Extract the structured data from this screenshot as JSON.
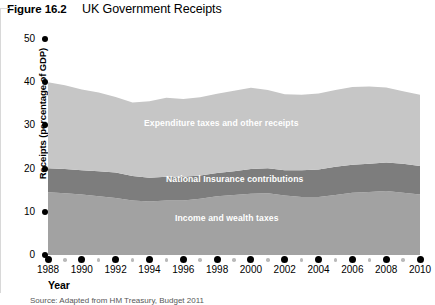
{
  "figure": {
    "number": "Figure 16.2",
    "title": "UK Government Receipts",
    "source": "Source: Adapted from HM Treasury, Budget 2011"
  },
  "chart_data": {
    "type": "area",
    "stacked": true,
    "title": "UK Government Receipts",
    "xlabel": "Year",
    "ylabel": "Receipts (percentage of GDP)",
    "xlim": [
      1988,
      2010
    ],
    "ylim": [
      0,
      50
    ],
    "yticks": [
      0,
      10,
      20,
      30,
      40,
      50
    ],
    "xticks": [
      1988,
      1990,
      1992,
      1994,
      1996,
      1998,
      2000,
      2002,
      2004,
      2006,
      2008,
      2010
    ],
    "grid": false,
    "legend": "inline-band-labels",
    "x": [
      1988,
      1989,
      1990,
      1991,
      1992,
      1993,
      1994,
      1995,
      1996,
      1997,
      1998,
      1999,
      2000,
      2001,
      2002,
      2003,
      2004,
      2005,
      2006,
      2007,
      2008,
      2009,
      2010
    ],
    "series": [
      {
        "name": "Income and wealth taxes",
        "color": "#a2a2a2",
        "values": [
          14.5,
          14.3,
          14.0,
          13.6,
          13.2,
          12.6,
          12.4,
          12.6,
          12.6,
          13.0,
          13.6,
          13.9,
          14.2,
          14.3,
          13.8,
          13.4,
          13.4,
          13.9,
          14.4,
          14.6,
          14.8,
          14.4,
          14.0
        ]
      },
      {
        "name": "National Insurance contributions",
        "color": "#7d7d7d",
        "values": [
          5.6,
          5.6,
          5.6,
          5.8,
          5.9,
          5.7,
          5.5,
          5.5,
          5.5,
          5.4,
          5.4,
          5.5,
          5.7,
          5.8,
          5.8,
          6.2,
          6.4,
          6.5,
          6.5,
          6.5,
          6.6,
          6.7,
          6.6
        ]
      },
      {
        "name": "Expenditure taxes and other receipts",
        "color": "#c6c6c6",
        "values": [
          19.9,
          19.4,
          18.7,
          18.2,
          17.5,
          17.0,
          17.7,
          18.3,
          18.0,
          18.1,
          18.3,
          18.6,
          18.8,
          18.1,
          17.6,
          17.5,
          17.6,
          17.8,
          18.0,
          17.9,
          17.4,
          16.8,
          16.5
        ]
      }
    ],
    "totals": [
      40.0,
      39.3,
      38.3,
      37.6,
      36.6,
      35.3,
      35.6,
      36.4,
      36.1,
      36.5,
      37.3,
      38.0,
      38.7,
      38.2,
      37.2,
      37.1,
      37.4,
      38.2,
      38.9,
      39.0,
      38.8,
      37.9,
      37.1
    ]
  },
  "axes": {
    "y_label": "Receipts (percentage of GDP)",
    "y_ticks": [
      "50",
      "40",
      "30",
      "20",
      "10",
      "0"
    ],
    "x_label": "Year",
    "x_ticks": [
      "1988",
      "1990",
      "1992",
      "1994",
      "1996",
      "1998",
      "2000",
      "2002",
      "2004",
      "2006",
      "2008",
      "2010"
    ]
  },
  "band_labels": {
    "expenditure": "Expenditure taxes and other receipts",
    "national_insurance": "National Insurance contributions",
    "income": "Income and wealth taxes"
  },
  "colors": {
    "expenditure": "#c6c6c6",
    "national_insurance": "#7d7d7d",
    "income": "#a2a2a2",
    "axis": "#000000",
    "minor_tick": "#b9b9b9"
  }
}
